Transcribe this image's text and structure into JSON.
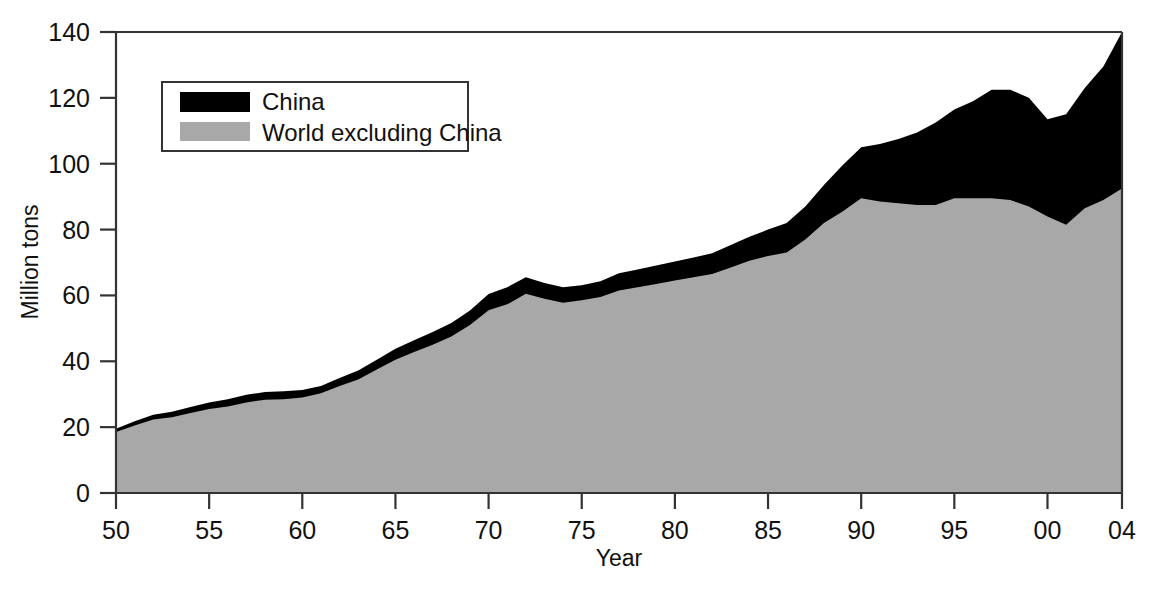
{
  "chart_data": {
    "type": "area",
    "stacked": true,
    "title": "",
    "subtitle": "",
    "xlabel": "Year",
    "ylabel": "Million tons",
    "xlim": [
      1950,
      2004
    ],
    "ylim": [
      0,
      140
    ],
    "grid": false,
    "legend_position": "top-left",
    "x_tick_labels": [
      "50",
      "55",
      "60",
      "65",
      "70",
      "75",
      "80",
      "85",
      "90",
      "95",
      "00",
      "04"
    ],
    "x_tick_values": [
      1950,
      1955,
      1960,
      1965,
      1970,
      1975,
      1980,
      1985,
      1990,
      1995,
      2000,
      2004
    ],
    "y_tick_labels": [
      "0",
      "20",
      "40",
      "60",
      "80",
      "100",
      "120",
      "140"
    ],
    "y_tick_values": [
      0,
      20,
      40,
      60,
      80,
      100,
      120,
      140
    ],
    "colors": {
      "china": "#000000",
      "world_excluding_china": "#a8a8a8",
      "axis": "#333333",
      "background": "#ffffff"
    },
    "x": [
      1950,
      1951,
      1952,
      1953,
      1954,
      1955,
      1956,
      1957,
      1958,
      1959,
      1960,
      1961,
      1962,
      1963,
      1964,
      1965,
      1966,
      1967,
      1968,
      1969,
      1970,
      1971,
      1972,
      1973,
      1974,
      1975,
      1976,
      1977,
      1978,
      1979,
      1980,
      1981,
      1982,
      1983,
      1984,
      1985,
      1986,
      1987,
      1988,
      1989,
      1990,
      1991,
      1992,
      1993,
      1994,
      1995,
      1996,
      1997,
      1998,
      1999,
      2000,
      2001,
      2002,
      2003,
      2004
    ],
    "series": [
      {
        "name": "World excluding China",
        "color": "#a8a8a8",
        "values": [
          18.5,
          20.5,
          22.3,
          23.0,
          24.3,
          25.5,
          26.3,
          27.5,
          28.3,
          28.5,
          29.0,
          30.3,
          32.5,
          34.5,
          37.5,
          40.5,
          42.8,
          45.0,
          47.5,
          51.0,
          55.5,
          57.3,
          60.5,
          59.0,
          57.8,
          58.5,
          59.5,
          61.5,
          62.5,
          63.5,
          64.5,
          65.5,
          66.5,
          68.5,
          70.5,
          72.0,
          73.0,
          77.0,
          82.0,
          85.5,
          89.5,
          88.5,
          88.0,
          87.5,
          87.5,
          89.5,
          89.5,
          89.5,
          89.0,
          87.0,
          84.0,
          81.5,
          86.5,
          89.0,
          92.5
        ]
      },
      {
        "name": "China",
        "color": "#000000",
        "values": [
          1.0,
          1.3,
          1.5,
          1.7,
          1.8,
          2.0,
          2.2,
          2.3,
          2.4,
          2.4,
          2.3,
          2.2,
          2.4,
          2.7,
          3.0,
          3.3,
          3.6,
          3.9,
          4.1,
          4.4,
          4.9,
          5.2,
          5.0,
          4.8,
          4.7,
          4.6,
          4.8,
          5.2,
          5.4,
          5.6,
          5.8,
          6.0,
          6.3,
          6.8,
          7.3,
          8.0,
          9.0,
          10.0,
          11.5,
          14.0,
          15.5,
          17.5,
          19.5,
          22.0,
          25.0,
          27.0,
          29.5,
          33.0,
          33.5,
          33.0,
          29.5,
          33.5,
          36.5,
          40.5,
          47.5
        ]
      }
    ],
    "annotations": [
      "Total reaches about 140 million tons in 2004",
      "Dip in world excluding China around 2001",
      "China share grows sharply after 1990"
    ]
  },
  "legend": {
    "entries": [
      {
        "label": "China",
        "swatch": "#000000"
      },
      {
        "label": "World excluding China",
        "swatch": "#a8a8a8"
      }
    ]
  },
  "axes": {
    "y_title": "Million tons",
    "x_title": "Year"
  }
}
